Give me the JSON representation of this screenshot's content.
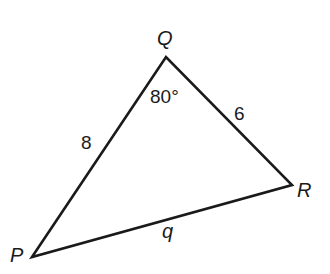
{
  "diagram": {
    "type": "triangle",
    "stroke_color": "#1a1a1a",
    "background": "#ffffff",
    "vertices": {
      "P": {
        "label": "P",
        "x": 32,
        "y": 257
      },
      "Q": {
        "label": "Q",
        "x": 166,
        "y": 57
      },
      "R": {
        "label": "R",
        "x": 292,
        "y": 185
      }
    },
    "sides": {
      "PQ": {
        "label": "8"
      },
      "QR": {
        "label": "6"
      },
      "PR": {
        "label": "q"
      }
    },
    "angles": {
      "Q": {
        "label": "80°"
      }
    }
  }
}
